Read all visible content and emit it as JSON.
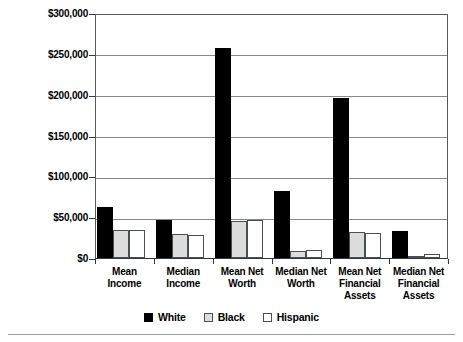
{
  "chart_data": {
    "type": "bar",
    "title": "",
    "subtitle": "",
    "xlabel": "",
    "ylabel": "",
    "ylim": [
      0,
      300000
    ],
    "grid": true,
    "legend_position": "bottom",
    "y_ticks": [
      "$0",
      "$50,000",
      "$100,000",
      "$150,000",
      "$200,000",
      "$250,000",
      "$300,000"
    ],
    "y_tick_values": [
      0,
      50000,
      100000,
      150000,
      200000,
      250000,
      300000
    ],
    "categories": [
      "Mean Income",
      "Median Income",
      "Mean Net Worth",
      "Median Net Worth",
      "Mean Net Financial Assets",
      "Median Net Financial Assets"
    ],
    "category_label_lines": [
      [
        "Mean",
        "Income"
      ],
      [
        "Median",
        "Income"
      ],
      [
        "Mean Net",
        "Worth"
      ],
      [
        "Median Net",
        "Worth"
      ],
      [
        "Mean Net",
        "Financial",
        "Assets"
      ],
      [
        "Median Net",
        "Financial",
        "Assets"
      ]
    ],
    "series": [
      {
        "name": "White",
        "color": "#000000",
        "values": [
          63000,
          47000,
          257000,
          82000,
          196000,
          33000
        ]
      },
      {
        "name": "Black",
        "color": "#dcdcdc",
        "values": [
          34000,
          29000,
          45000,
          8000,
          32000,
          3000
        ]
      },
      {
        "name": "Hispanic",
        "color": "#ffffff",
        "values": [
          34000,
          28000,
          47000,
          10000,
          31000,
          5000
        ]
      }
    ]
  },
  "legend": {
    "items": [
      {
        "label": "White"
      },
      {
        "label": "Black"
      },
      {
        "label": "Hispanic"
      }
    ]
  }
}
